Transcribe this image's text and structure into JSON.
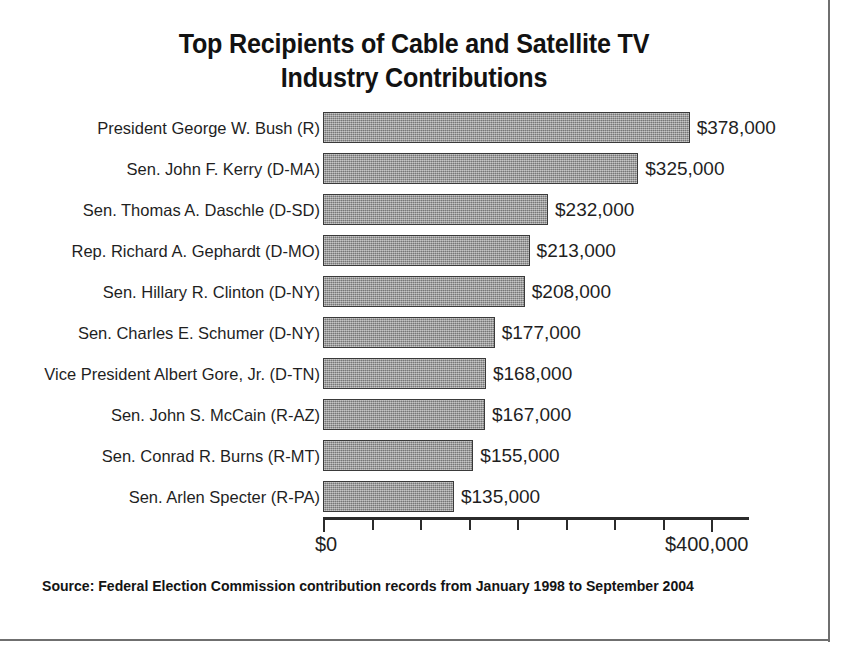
{
  "chart_data": {
    "type": "bar",
    "orientation": "horizontal",
    "title": "Top Recipients of Cable and Satellite TV Industry Contributions",
    "title_lines": [
      "Top Recipients of Cable and Satellite TV",
      "Industry Contributions"
    ],
    "xlabel": "",
    "ylabel": "",
    "grid": false,
    "legend": null,
    "xlim": [
      0,
      400000
    ],
    "x_tick_values": [
      0,
      50000,
      100000,
      150000,
      200000,
      250000,
      300000,
      350000,
      400000
    ],
    "x_tick_labels_shown": [
      "$0",
      "$400,000"
    ],
    "x_axis_min_label": "$0",
    "x_axis_max_label": "$400,000",
    "categories": [
      "President George W. Bush (R)",
      "Sen. John F. Kerry (D-MA)",
      "Sen. Thomas A. Daschle (D-SD)",
      "Rep. Richard A. Gephardt (D-MO)",
      "Sen. Hillary R. Clinton (D-NY)",
      "Sen. Charles E. Schumer (D-NY)",
      "Vice President Albert Gore, Jr. (D-TN)",
      "Sen. John S. McCain (R-AZ)",
      "Sen. Conrad R. Burns (R-MT)",
      "Sen. Arlen Specter (R-PA)"
    ],
    "values": [
      378000,
      325000,
      232000,
      213000,
      208000,
      177000,
      168000,
      167000,
      155000,
      135000
    ],
    "value_labels": [
      "$378,000",
      "$325,000",
      "$232,000",
      "$213,000",
      "$208,000",
      "$177,000",
      "$168,000",
      "$167,000",
      "$155,000",
      "$135,000"
    ],
    "bar_color": "#919191",
    "bar_edge_color": "#3a3a3a",
    "annotations": [
      "Source: Federal Election Commission contribution records from January 1998 to September 2004"
    ]
  },
  "source_note": "Source: Federal Election Commission contribution records from January 1998 to September 2004"
}
